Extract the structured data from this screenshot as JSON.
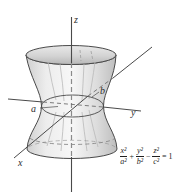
{
  "figure": {
    "background": "#ffffff",
    "line_color": "#4a4a4a",
    "hidden_line_color": "#777777",
    "z_dash_color": "#8a8a8a",
    "meridian_color": "#b9b9b9",
    "surface_light": "#f5f5f5",
    "surface_dark": "#c3c3c3",
    "axis_labels": {
      "z": "z",
      "y": "y",
      "x": "x"
    },
    "semiaxis_labels": {
      "a": "a",
      "b": "b"
    },
    "equation": {
      "terms": [
        {
          "num": "x²",
          "den": "a²"
        },
        {
          "num": "y²",
          "den": "b²"
        },
        {
          "num": "z²",
          "den": "c²"
        }
      ],
      "op_plus": "+",
      "op_minus": "−",
      "rhs": "= 1",
      "text": "x²/a² + y²/b² − z²/c² = 1"
    }
  }
}
